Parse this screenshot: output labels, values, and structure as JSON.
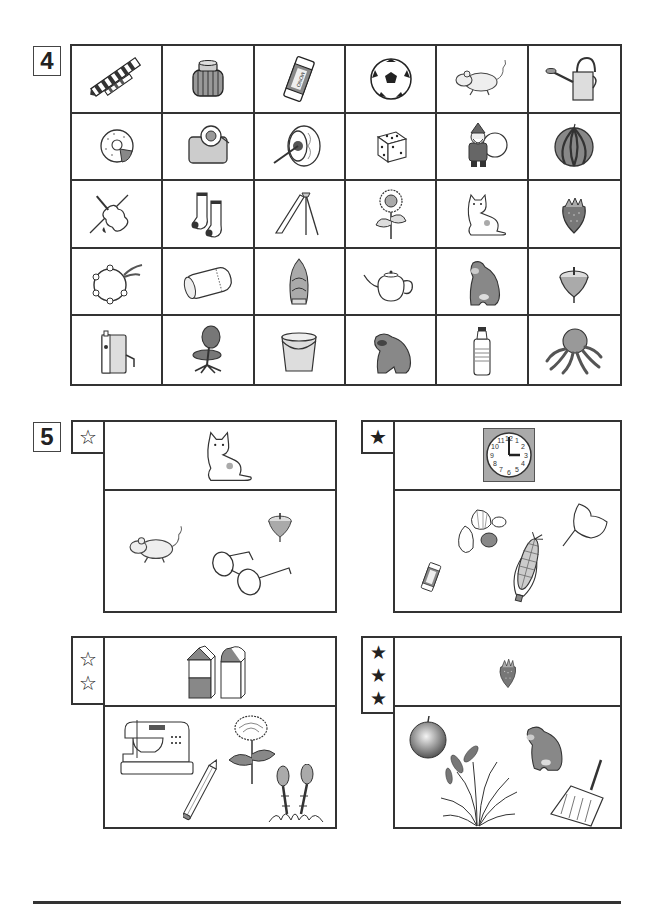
{
  "page": {
    "background": "#ffffff",
    "line_color": "#333333"
  },
  "section4": {
    "number": "4",
    "grid": {
      "columns": 6,
      "rows": 5,
      "cells": [
        [
          "necktie",
          "ink-bottle",
          "eraser",
          "soccer-ball",
          "mouse",
          "watering-can"
        ],
        [
          "donut",
          "tape-dispenser",
          "taiko-drum",
          "dice",
          "santa-claus",
          "watermelon"
        ],
        [
          "violin",
          "socks",
          "slide",
          "sunflower",
          "cat",
          "strawberry"
        ],
        [
          "tambourine",
          "pillow",
          "bamboo-shoot",
          "teapot",
          "gorilla",
          "spinning-top"
        ],
        [
          "pencil-sharpener",
          "office-chair",
          "bucket",
          "raccoon-dog",
          "water-bottle",
          "octopus"
        ]
      ]
    }
  },
  "section5": {
    "number": "5",
    "panels": [
      {
        "difficulty_stars": 1,
        "star_style": "outline",
        "star_glyph": "☆",
        "prompt_item": "cat",
        "choices": [
          "mouse",
          "spinning-top",
          "glasses"
        ]
      },
      {
        "difficulty_stars": 1,
        "star_style": "filled",
        "star_glyph": "★",
        "prompt_item": "clock",
        "clock_numbers": [
          "12",
          "1",
          "2",
          "3",
          "4",
          "5",
          "6",
          "7",
          "8",
          "9",
          "10",
          "11"
        ],
        "choices": [
          "shells",
          "ginkgo-leaf",
          "eraser",
          "corn"
        ]
      },
      {
        "difficulty_stars": 2,
        "star_style": "outline",
        "star_glyph": "☆",
        "prompt_item": "building-blocks",
        "choices": [
          "sewing-machine",
          "chrysanthemum",
          "pencil",
          "horsetail"
        ]
      },
      {
        "difficulty_stars": 3,
        "star_style": "filled",
        "star_glyph": "★",
        "prompt_item": "strawberry",
        "choices": [
          "apple",
          "gorilla",
          "rice-plant",
          "dustpan"
        ]
      }
    ]
  },
  "icons": {
    "eraser_label": "MONO"
  }
}
